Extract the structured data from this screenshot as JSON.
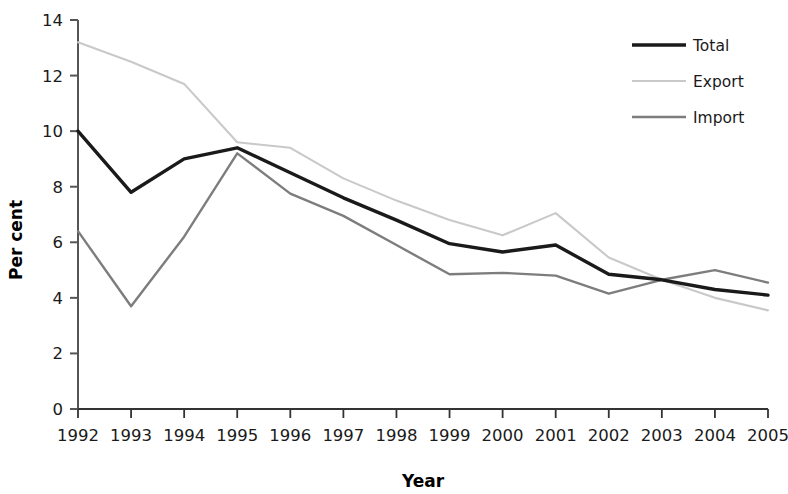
{
  "chart_data": {
    "type": "line",
    "title": "",
    "xlabel": "Year",
    "ylabel": "Per cent",
    "categories": [
      "1992",
      "1993",
      "1994",
      "1995",
      "1996",
      "1997",
      "1998",
      "1999",
      "2000",
      "2001",
      "2002",
      "2003",
      "2004",
      "2005"
    ],
    "x": [
      1992,
      1993,
      1994,
      1995,
      1996,
      1997,
      1998,
      1999,
      2000,
      2001,
      2002,
      2003,
      2004,
      2005
    ],
    "ylim": [
      0,
      14
    ],
    "yticks": [
      0,
      2,
      4,
      6,
      8,
      10,
      12,
      14
    ],
    "ytick_labels": [
      "0",
      "2",
      "4",
      "6",
      "8",
      "10",
      "12",
      "14"
    ],
    "grid": false,
    "legend_position": "top-right",
    "series": [
      {
        "name": "Total",
        "color": "#1a1a1a",
        "width": 3.4,
        "values": [
          10.0,
          7.8,
          9.0,
          9.4,
          8.5,
          7.6,
          6.8,
          5.95,
          5.65,
          5.9,
          4.85,
          4.65,
          4.3,
          4.1
        ]
      },
      {
        "name": "Export",
        "color": "#c9c9c9",
        "width": 2.1,
        "values": [
          13.2,
          12.5,
          11.7,
          9.6,
          9.4,
          8.3,
          7.5,
          6.8,
          6.25,
          7.05,
          5.45,
          4.65,
          4.0,
          3.55
        ]
      },
      {
        "name": "Import",
        "color": "#7d7d7d",
        "width": 2.4,
        "values": [
          6.4,
          3.7,
          6.2,
          9.2,
          7.75,
          6.95,
          5.9,
          4.85,
          4.9,
          4.8,
          4.15,
          4.65,
          5.0,
          4.55
        ]
      }
    ]
  },
  "axis": {
    "x_title": "Year",
    "y_title": "Per cent"
  },
  "legend": {
    "items": [
      {
        "label": "Total"
      },
      {
        "label": "Export"
      },
      {
        "label": "Import"
      }
    ]
  }
}
